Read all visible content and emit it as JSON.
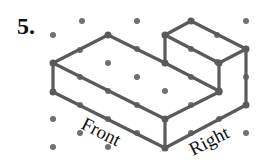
{
  "problem": {
    "number": "5.",
    "labels": {
      "front": "Front",
      "right": "Right"
    },
    "colors": {
      "line": "#5a5a5a",
      "dot": "#707070",
      "text": "#111111"
    },
    "grid_dots": [
      [
        82,
        21
      ],
      [
        137,
        21
      ],
      [
        191,
        21
      ],
      [
        246,
        21
      ],
      [
        53,
        35
      ],
      [
        108,
        35
      ],
      [
        165,
        35
      ],
      [
        217,
        35
      ],
      [
        80,
        50
      ],
      [
        137,
        49
      ],
      [
        191,
        49
      ],
      [
        246,
        49
      ],
      [
        53,
        63
      ],
      [
        108,
        63
      ],
      [
        165,
        63
      ],
      [
        217,
        62
      ],
      [
        80,
        77
      ],
      [
        137,
        77
      ],
      [
        191,
        77
      ],
      [
        246,
        77
      ],
      [
        53,
        92
      ],
      [
        108,
        91
      ],
      [
        165,
        91
      ],
      [
        219,
        92
      ],
      [
        80,
        105
      ],
      [
        137,
        105
      ],
      [
        191,
        105
      ],
      [
        246,
        105
      ],
      [
        53,
        119
      ],
      [
        108,
        119
      ],
      [
        165,
        119
      ],
      [
        219,
        119
      ],
      [
        80,
        133
      ],
      [
        137,
        133
      ],
      [
        191,
        133
      ],
      [
        246,
        133
      ],
      [
        53,
        147
      ],
      [
        108,
        147
      ],
      [
        165,
        148
      ]
    ],
    "edges": [
      [
        [
          53,
          63
        ],
        [
          108,
          35
        ]
      ],
      [
        [
          108,
          35
        ],
        [
          165,
          63
        ]
      ],
      [
        [
          53,
          63
        ],
        [
          165,
          119
        ]
      ],
      [
        [
          53,
          63
        ],
        [
          53,
          92
        ]
      ],
      [
        [
          53,
          92
        ],
        [
          165,
          148
        ]
      ],
      [
        [
          165,
          119
        ],
        [
          165,
          148
        ]
      ],
      [
        [
          165,
          148
        ],
        [
          246,
          105
        ]
      ],
      [
        [
          246,
          49
        ],
        [
          246,
          105
        ]
      ],
      [
        [
          165,
          119
        ],
        [
          219,
          92
        ]
      ],
      [
        [
          219,
          63
        ],
        [
          219,
          92
        ]
      ],
      [
        [
          165,
          63
        ],
        [
          219,
          91
        ]
      ],
      [
        [
          165,
          35
        ],
        [
          191,
          21
        ]
      ],
      [
        [
          191,
          21
        ],
        [
          246,
          49
        ]
      ],
      [
        [
          165,
          35
        ],
        [
          219,
          63
        ]
      ],
      [
        [
          219,
          63
        ],
        [
          246,
          49
        ]
      ],
      [
        [
          165,
          35
        ],
        [
          165,
          63
        ]
      ]
    ]
  }
}
